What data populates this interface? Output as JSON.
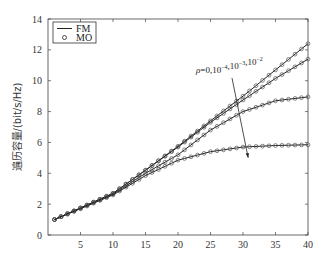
{
  "chart_data": {
    "type": "line",
    "title": "",
    "xlabel": "",
    "ylabel": "遍历容量/(bit/s/Hz)",
    "xlim": [
      0,
      40
    ],
    "ylim": [
      0,
      14
    ],
    "xticks": [
      5,
      10,
      15,
      20,
      25,
      30,
      35,
      40
    ],
    "xtick_labels": [
      "5",
      "10",
      "15",
      "20",
      "25",
      "30",
      "35",
      "40"
    ],
    "yticks": [
      0,
      2,
      4,
      6,
      8,
      10,
      12,
      14
    ],
    "ytick_labels": [
      "0",
      "2",
      "4",
      "6",
      "8",
      "10",
      "12",
      "14"
    ],
    "grid": false,
    "legend": {
      "position": "top-left",
      "entries": [
        {
          "label": "FM",
          "marker": "line"
        },
        {
          "label": "MO",
          "marker": "circle"
        }
      ]
    },
    "annotation": {
      "text_prefix": "ρ=0,10",
      "parts": [
        {
          "base": "ρ=0,10",
          "exp": "-4"
        },
        {
          "base": ",10",
          "exp": "-3"
        },
        {
          "base": ",10",
          "exp": "-2"
        }
      ],
      "arrow": {
        "from": [
          28.5,
          9.2
        ],
        "to": [
          30.8,
          5.0
        ]
      }
    },
    "x": [
      1,
      2,
      3,
      4,
      5,
      6,
      7,
      8,
      9,
      10,
      11,
      12,
      13,
      14,
      15,
      16,
      17,
      18,
      19,
      20,
      21,
      22,
      23,
      24,
      25,
      26,
      27,
      28,
      29,
      30,
      31,
      32,
      33,
      34,
      35,
      36,
      37,
      38,
      39,
      40
    ],
    "series": [
      {
        "name": "ρ=0",
        "values": [
          1.0,
          1.19,
          1.38,
          1.56,
          1.75,
          1.94,
          2.13,
          2.32,
          2.51,
          2.7,
          3.0,
          3.3,
          3.6,
          3.9,
          4.2,
          4.51,
          4.82,
          5.13,
          5.44,
          5.75,
          6.08,
          6.41,
          6.74,
          7.07,
          7.4,
          7.72,
          8.04,
          8.36,
          8.68,
          9.0,
          9.34,
          9.68,
          10.02,
          10.36,
          10.7,
          11.04,
          11.38,
          11.72,
          12.06,
          12.4
        ]
      },
      {
        "name": "ρ=1e-4",
        "values": [
          1.0,
          1.19,
          1.38,
          1.56,
          1.75,
          1.94,
          2.13,
          2.32,
          2.51,
          2.7,
          3.0,
          3.3,
          3.6,
          3.9,
          4.2,
          4.5,
          4.8,
          5.1,
          5.4,
          5.7,
          6.02,
          6.34,
          6.66,
          6.98,
          7.3,
          7.59,
          7.88,
          8.17,
          8.46,
          8.75,
          9.03,
          9.31,
          9.59,
          9.87,
          10.15,
          10.4,
          10.65,
          10.9,
          11.15,
          11.4
        ]
      },
      {
        "name": "ρ=1e-3",
        "values": [
          1.0,
          1.19,
          1.38,
          1.56,
          1.75,
          1.93,
          2.11,
          2.29,
          2.47,
          2.65,
          2.92,
          3.19,
          3.46,
          3.73,
          4.0,
          4.24,
          4.48,
          4.72,
          4.96,
          5.2,
          5.52,
          5.84,
          6.16,
          6.48,
          6.8,
          7.04,
          7.28,
          7.52,
          7.76,
          8.0,
          8.14,
          8.28,
          8.42,
          8.56,
          8.7,
          8.75,
          8.8,
          8.85,
          8.9,
          8.95
        ]
      },
      {
        "name": "ρ=1e-2",
        "values": [
          1.0,
          1.18,
          1.35,
          1.53,
          1.7,
          1.88,
          2.06,
          2.24,
          2.42,
          2.6,
          2.85,
          3.1,
          3.35,
          3.6,
          3.85,
          4.05,
          4.25,
          4.45,
          4.65,
          4.85,
          4.96,
          5.07,
          5.18,
          5.29,
          5.4,
          5.46,
          5.52,
          5.58,
          5.64,
          5.7,
          5.72,
          5.74,
          5.76,
          5.78,
          5.8,
          5.81,
          5.82,
          5.83,
          5.84,
          5.85
        ]
      }
    ]
  }
}
